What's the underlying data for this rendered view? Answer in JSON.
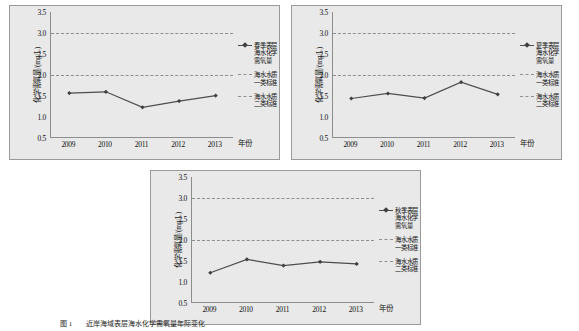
{
  "axis": {
    "ylabel": "化学需氧量/(mg/L)",
    "xlabel": "年份",
    "yticks": [
      "3.5",
      "3.0",
      "2.5",
      "2.0",
      "1.5",
      "1.0",
      "0.5"
    ],
    "ylim": [
      0.5,
      3.5
    ],
    "xticks": [
      "2009",
      "2010",
      "2011",
      "2012",
      "2013"
    ]
  },
  "legend": {
    "class1_label": "海水水质一类标准",
    "class2_label": "海水水质二类标准"
  },
  "caption": {
    "number": "图 1",
    "text": "近岸海域表层海水化学需氧量年际变化"
  },
  "colors": {
    "panel_bg": "#e9e9e9",
    "panel_border": "#9a9a9a",
    "series_line": "#4d4d4d",
    "marker": "#3f3f3f",
    "refline": "#8f8f8f",
    "axis": "#8d8d8d"
  },
  "chart_data": [
    {
      "type": "line",
      "id": "spring",
      "title": "",
      "series_name": "春季表层海水化学需氧量",
      "x": [
        "2009",
        "2010",
        "2011",
        "2012",
        "2013"
      ],
      "values": [
        1.57,
        1.6,
        1.23,
        1.38,
        1.51
      ],
      "xlabel": "年份",
      "ylabel": "化学需氧量/(mg/L)",
      "ylim": [
        0.5,
        3.5
      ],
      "ytick_step": 0.5,
      "grid": false,
      "legend_position": "right",
      "reference_lines": [
        {
          "label": "海水水质一类标准",
          "value": 2.0,
          "style": "dashed"
        },
        {
          "label": "海水水质二类标准",
          "value": 3.0,
          "style": "dashed"
        }
      ]
    },
    {
      "type": "line",
      "id": "summer",
      "title": "",
      "series_name": "夏季表层海水化学需氧量",
      "x": [
        "2009",
        "2010",
        "2011",
        "2012",
        "2013"
      ],
      "values": [
        1.44,
        1.56,
        1.45,
        1.83,
        1.54
      ],
      "xlabel": "年份",
      "ylabel": "化学需氧量/(mg/L)",
      "ylim": [
        0.5,
        3.5
      ],
      "ytick_step": 0.5,
      "grid": false,
      "legend_position": "right",
      "reference_lines": [
        {
          "label": "海水水质一类标准",
          "value": 2.0,
          "style": "dashed"
        },
        {
          "label": "海水水质二类标准",
          "value": 3.0,
          "style": "dashed"
        }
      ]
    },
    {
      "type": "line",
      "id": "autumn",
      "title": "",
      "series_name": "秋季表层海水化学需氧量",
      "x": [
        "2009",
        "2010",
        "2011",
        "2012",
        "2013"
      ],
      "values": [
        1.22,
        1.54,
        1.39,
        1.48,
        1.43
      ],
      "xlabel": "年份",
      "ylabel": "化学需氧量/(mg/L)",
      "ylim": [
        0.5,
        3.5
      ],
      "ytick_step": 0.5,
      "grid": false,
      "legend_position": "right",
      "reference_lines": [
        {
          "label": "海水水质一类标准",
          "value": 2.0,
          "style": "dashed"
        },
        {
          "label": "海水水质二类标准",
          "value": 3.0,
          "style": "dashed"
        }
      ]
    }
  ]
}
